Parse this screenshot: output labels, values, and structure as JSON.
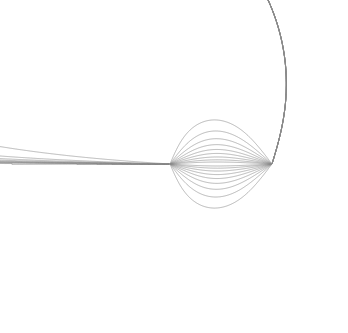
{
  "figure": {
    "title": "",
    "kind": "field-line-diagram",
    "width": 348,
    "height": 333,
    "background_color": "#ffffff",
    "line_color": "#8a8a8a",
    "line_width": 0.62
  },
  "chart_data": {
    "type": "line",
    "title": "",
    "subtitle": "",
    "xlabel": "",
    "ylabel": "",
    "grid": false,
    "legend": null,
    "axes_visible": false,
    "tick_labels_x": [],
    "tick_labels_y": [],
    "xlim": [
      0,
      348
    ],
    "ylim": [
      0,
      333
    ],
    "sources": [
      {
        "name": "source-left",
        "x": 170,
        "y": 164,
        "sign": "+"
      },
      {
        "name": "sink-right",
        "x": 272,
        "y": 164,
        "sign": "-"
      }
    ],
    "waist_x": 217,
    "axis_y": 164,
    "series": [
      {
        "name": "loop-1",
        "closed": true,
        "left_x": 163,
        "right_x": 177,
        "top_y": 157,
        "bottom_y": 171
      },
      {
        "name": "loop-2",
        "closed": true,
        "left_x": 155,
        "right_x": 184,
        "top_y": 150,
        "bottom_y": 178
      },
      {
        "name": "loop-3",
        "closed": true,
        "left_x": 148,
        "right_x": 191,
        "top_y": 143,
        "bottom_y": 185
      },
      {
        "name": "loop-4",
        "closed": true,
        "left_x": 140,
        "right_x": 198,
        "top_y": 135,
        "bottom_y": 193
      },
      {
        "name": "loop-5",
        "closed": true,
        "left_x": 131,
        "right_x": 204,
        "top_y": 127,
        "bottom_y": 201
      },
      {
        "name": "loop-6",
        "closed": true,
        "left_x": 122,
        "right_x": 209,
        "top_y": 118,
        "bottom_y": 210
      },
      {
        "name": "loop-7",
        "closed": true,
        "left_x": 112,
        "right_x": 212,
        "top_y": 108,
        "bottom_y": 220
      },
      {
        "name": "loop-8",
        "closed": true,
        "left_x": 97,
        "right_x": 215,
        "top_y": 95,
        "bottom_y": 233
      },
      {
        "name": "loop-9",
        "closed": true,
        "left_x": 77,
        "right_x": 216,
        "top_y": 78,
        "bottom_y": 250
      },
      {
        "name": "loop-10-clipped",
        "closed": true,
        "left_x": 12,
        "right_x": 217,
        "top_y": 18,
        "bottom_y": 310
      },
      {
        "name": "open-line-1",
        "closed": false,
        "waist_offset": 1,
        "note": "exits top and bottom of frame, nearly vertical"
      },
      {
        "name": "open-line-2",
        "closed": false,
        "waist_offset": 2,
        "note": "exits top and bottom of frame"
      },
      {
        "name": "open-line-3",
        "closed": false,
        "waist_offset": 3,
        "note": "exits top and bottom of frame, slight right lean"
      },
      {
        "name": "open-line-4",
        "closed": false,
        "waist_offset": 4,
        "note": "curves right, exits top-right and bottom-right"
      },
      {
        "name": "open-line-5",
        "closed": false,
        "waist_offset": 5,
        "note": "curves right toward right edge"
      },
      {
        "name": "open-line-6",
        "closed": false,
        "waist_offset": 6,
        "note": "curves right, exits right edge upper"
      },
      {
        "name": "open-line-7",
        "closed": false,
        "waist_offset": 7,
        "note": "curves right, exits right edge"
      },
      {
        "name": "open-line-8",
        "closed": false,
        "waist_offset": 8,
        "note": "large arc around right lobe, exits right edge"
      },
      {
        "name": "open-line-9",
        "closed": false,
        "waist_offset": 9,
        "note": "outermost arc wrapping right lobe"
      }
    ]
  }
}
